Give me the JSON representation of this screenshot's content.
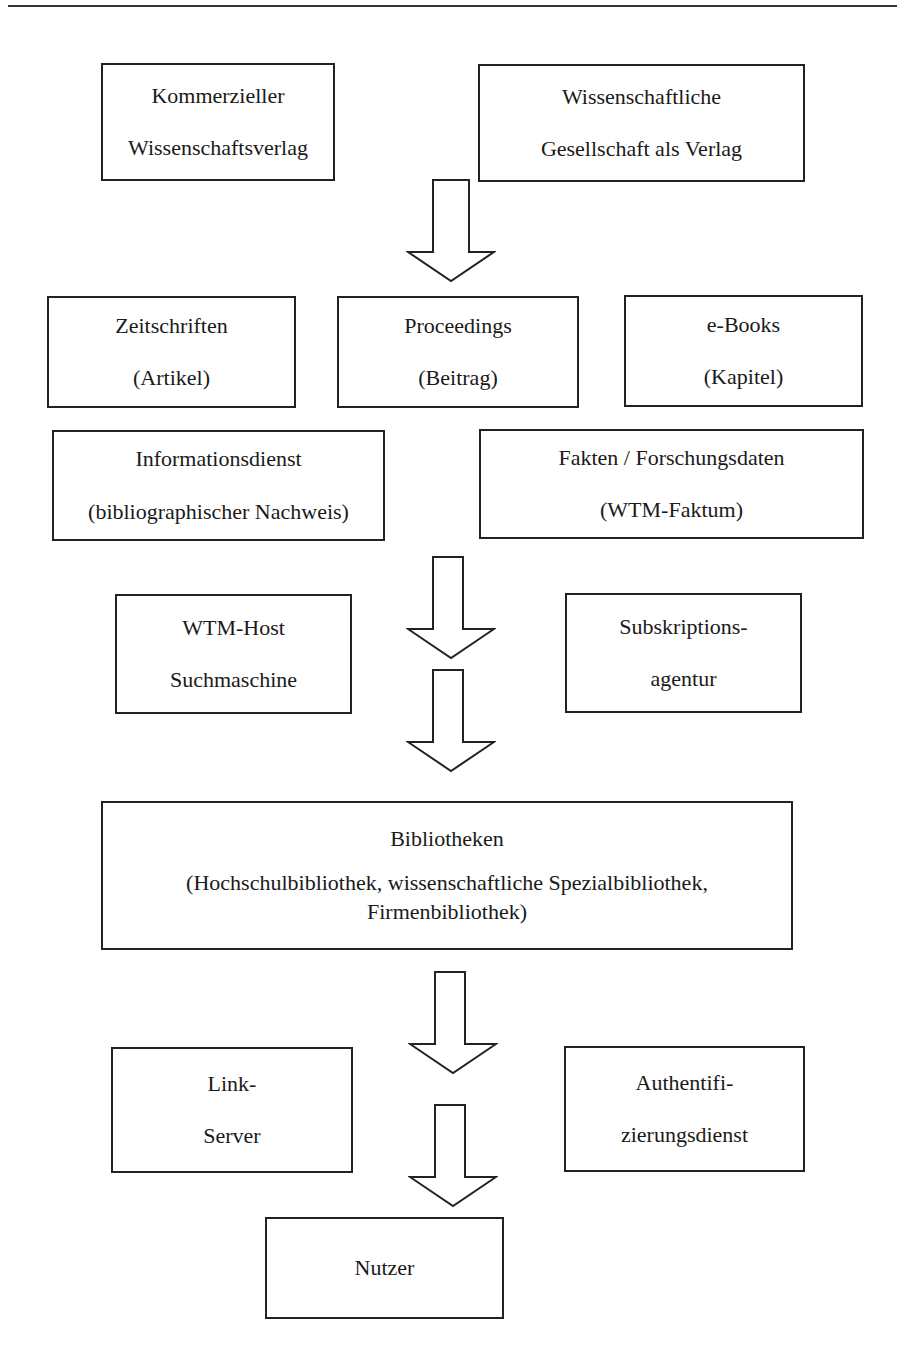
{
  "page": {
    "top_rule": true
  },
  "diagram": {
    "publishers": [
      {
        "line1": "Kommerzieller",
        "line2": "Wissenschaftsverlag"
      },
      {
        "line1": "Wissenschaftliche",
        "line2": "Gesellschaft als Verlag"
      }
    ],
    "products": [
      {
        "line1": "Zeitschriften",
        "line2": "(Artikel)"
      },
      {
        "line1": "Proceedings",
        "line2": "(Beitrag)"
      },
      {
        "line1": "e-Books",
        "line2": "(Kapitel)"
      }
    ],
    "services": [
      {
        "line1": "Informationsdienst",
        "line2": "(bibliographischer Nachweis)"
      },
      {
        "line1": "Fakten / Forschungsdaten",
        "line2": "(WTM-Faktum)"
      }
    ],
    "intermediaries": [
      {
        "line1": "WTM-Host",
        "line2": "Suchmaschine"
      },
      {
        "line1": "Subskriptions-",
        "line2": "agentur"
      }
    ],
    "libraries": {
      "title": "Bibliotheken",
      "line2": "(Hochschulbibliothek, wissenschaftliche Spezialbibliothek,",
      "line3": "Firmenbibliothek)"
    },
    "access": [
      {
        "line1": "Link-",
        "line2": "Server"
      },
      {
        "line1": "Authentifi-",
        "line2": "zierungsdienst"
      }
    ],
    "end_user": {
      "label": "Nutzer"
    },
    "arrows": [
      {
        "id": "publishers-to-products",
        "direction": "down"
      },
      {
        "id": "services-to-intermediaries",
        "direction": "down"
      },
      {
        "id": "intermediaries-to-libraries",
        "direction": "down"
      },
      {
        "id": "libraries-to-access",
        "direction": "down"
      },
      {
        "id": "access-to-user",
        "direction": "down"
      }
    ]
  }
}
